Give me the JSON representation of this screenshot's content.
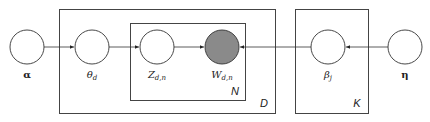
{
  "diagram": {
    "type": "plate-notation",
    "nodes": [
      {
        "id": "alpha",
        "label": "α",
        "observed": false
      },
      {
        "id": "theta",
        "label": "θ",
        "sub": "d",
        "observed": false
      },
      {
        "id": "z",
        "label": "Z",
        "sub": "d,n",
        "observed": false
      },
      {
        "id": "w",
        "label": "W",
        "sub": "d,n",
        "observed": true
      },
      {
        "id": "beta",
        "label": "β",
        "sub": "j",
        "observed": false
      },
      {
        "id": "eta",
        "label": "η",
        "observed": false
      }
    ],
    "edges": [
      {
        "from": "alpha",
        "to": "theta"
      },
      {
        "from": "theta",
        "to": "z"
      },
      {
        "from": "z",
        "to": "w"
      },
      {
        "from": "beta",
        "to": "w"
      },
      {
        "from": "eta",
        "to": "beta"
      }
    ],
    "plates": [
      {
        "id": "N",
        "label": "N",
        "contains": [
          "z",
          "w"
        ]
      },
      {
        "id": "D",
        "label": "D",
        "contains": [
          "theta",
          "z",
          "w"
        ]
      },
      {
        "id": "K",
        "label": "K",
        "contains": [
          "beta"
        ]
      }
    ],
    "colors": {
      "observed_fill": "#8a8a8a",
      "stroke": "#333333"
    }
  }
}
